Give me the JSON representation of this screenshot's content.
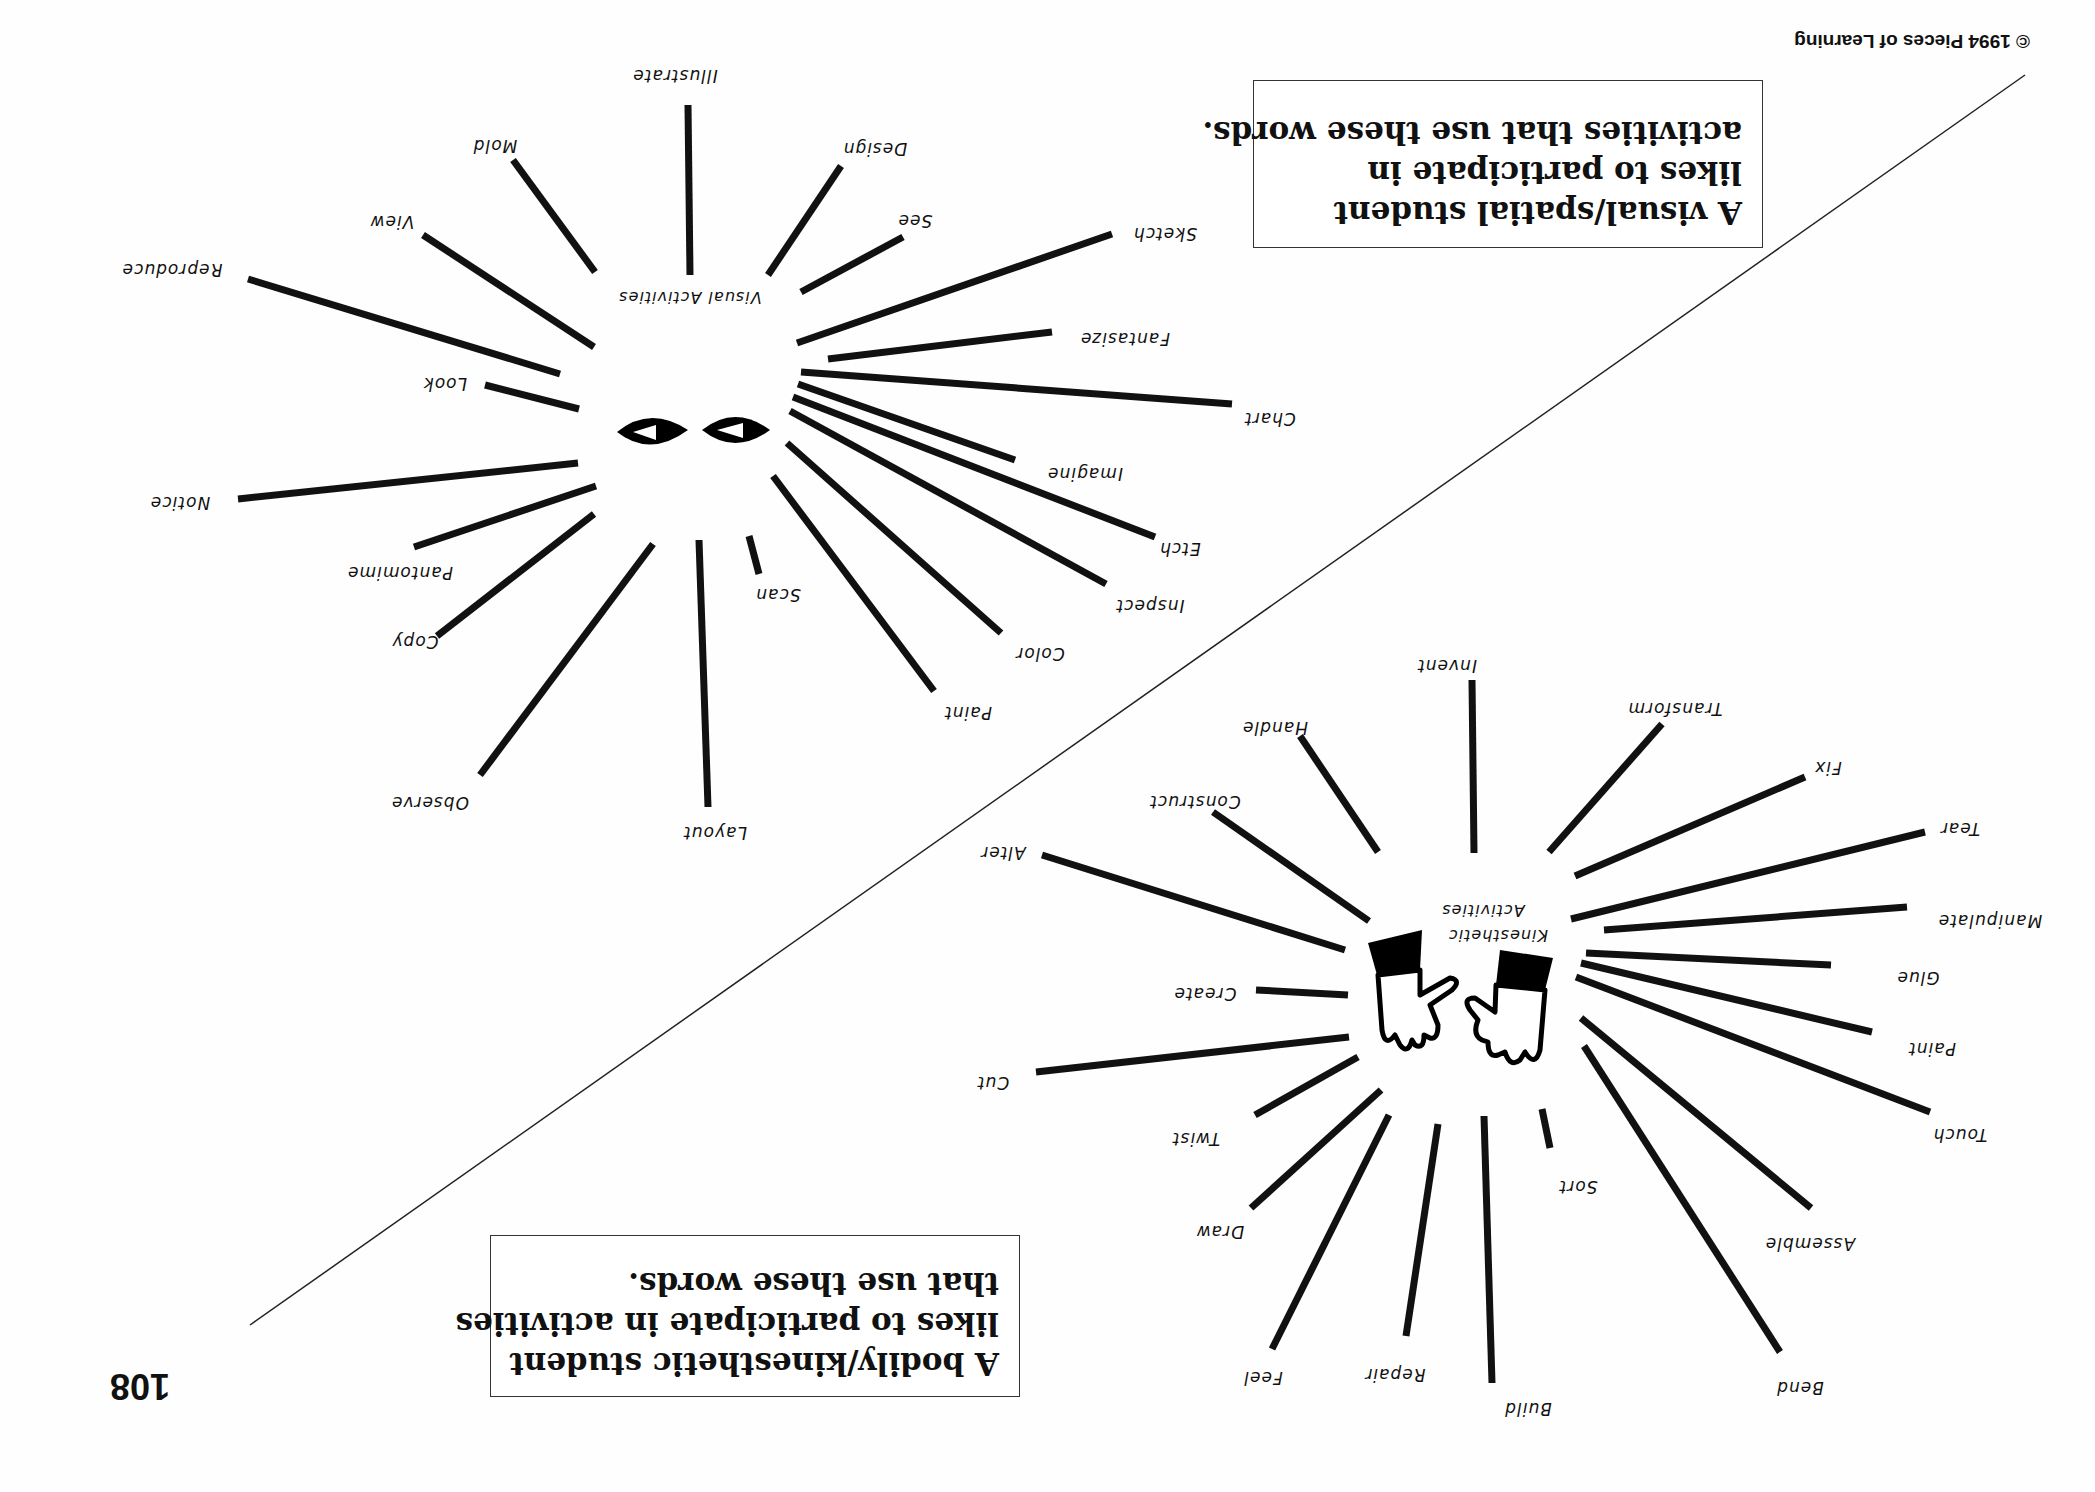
{
  "page": {
    "number": "108",
    "copyright": "© 1994 Pieces of Learning",
    "orientation": "rotated 180 degrees"
  },
  "visual": {
    "caption": [
      "A visual/spatial student",
      "likes to participate in",
      "activities that use these words."
    ],
    "hub_label": "Visual Activities",
    "icon": "eyes-icon",
    "words": [
      {
        "label": "Illustrate",
        "x": 675,
        "y": 70,
        "ray": [
          688,
          105,
          690,
          275
        ]
      },
      {
        "label": "Mold",
        "x": 495,
        "y": 140,
        "ray": [
          513,
          160,
          595,
          272
        ]
      },
      {
        "label": "Design",
        "x": 875,
        "y": 143,
        "ray": [
          841,
          166,
          768,
          275
        ]
      },
      {
        "label": "See",
        "x": 915,
        "y": 215,
        "ray": [
          903,
          237,
          801,
          292
        ]
      },
      {
        "label": "View",
        "x": 392,
        "y": 216,
        "ray": [
          423,
          235,
          594,
          347
        ]
      },
      {
        "label": "Sketch",
        "x": 1165,
        "y": 228,
        "ray": [
          1112,
          234,
          797,
          343
        ]
      },
      {
        "label": "Reproduce",
        "x": 172,
        "y": 264,
        "ray": [
          248,
          279,
          560,
          374
        ]
      },
      {
        "label": "Fantasize",
        "x": 1125,
        "y": 333,
        "ray": [
          1052,
          332,
          828,
          359
        ]
      },
      {
        "label": "Look",
        "x": 445,
        "y": 378,
        "ray": [
          485,
          385,
          579,
          409
        ]
      },
      {
        "label": "Chart",
        "x": 1270,
        "y": 413,
        "ray": [
          1232,
          404,
          801,
          372
        ]
      },
      {
        "label": "Imagine",
        "x": 1085,
        "y": 468,
        "ray": [
          1015,
          460,
          798,
          384
        ]
      },
      {
        "label": "Notice",
        "x": 180,
        "y": 497,
        "ray": [
          238,
          499,
          578,
          463
        ]
      },
      {
        "label": "Etch",
        "x": 1180,
        "y": 543,
        "ray": [
          1155,
          537,
          793,
          397
        ]
      },
      {
        "label": "Pantomime",
        "x": 400,
        "y": 567,
        "ray": [
          414,
          547,
          596,
          486
        ]
      },
      {
        "label": "Inspect",
        "x": 1150,
        "y": 600,
        "ray": [
          1106,
          584,
          790,
          411
        ]
      },
      {
        "label": "Scan",
        "x": 778,
        "y": 589,
        "ray": [
          759,
          574,
          749,
          536
        ]
      },
      {
        "label": "Copy",
        "x": 415,
        "y": 636,
        "ray": [
          437,
          636,
          594,
          514
        ]
      },
      {
        "label": "Color",
        "x": 1040,
        "y": 648,
        "ray": [
          1001,
          633,
          787,
          443
        ]
      },
      {
        "label": "Paint",
        "x": 968,
        "y": 707,
        "ray": [
          934,
          691,
          773,
          476
        ]
      },
      {
        "label": "Observe",
        "x": 430,
        "y": 797,
        "ray": [
          480,
          775,
          653,
          544
        ]
      },
      {
        "label": "Layout",
        "x": 715,
        "y": 827,
        "ray": [
          708,
          807,
          699,
          540
        ]
      }
    ]
  },
  "kinesthetic": {
    "caption": [
      "A bodily/kinesthetic student",
      "likes to participate in activities",
      "that use these words."
    ],
    "hub_label": [
      "Kinesthetic",
      "Activities"
    ],
    "icon": "hands-icon",
    "words": [
      {
        "label": "Invent",
        "x": 1447,
        "y": 660,
        "ray": [
          1472,
          680,
          1474,
          853
        ]
      },
      {
        "label": "Transform",
        "x": 1675,
        "y": 703,
        "ray": [
          1662,
          724,
          1549,
          852
        ]
      },
      {
        "label": "Handle",
        "x": 1275,
        "y": 722,
        "ray": [
          1300,
          736,
          1378,
          852
        ]
      },
      {
        "label": "Fix",
        "x": 1828,
        "y": 762,
        "ray": [
          1805,
          777,
          1575,
          876
        ]
      },
      {
        "label": "Construct",
        "x": 1195,
        "y": 796,
        "ray": [
          1213,
          812,
          1369,
          921
        ]
      },
      {
        "label": "Tear",
        "x": 1960,
        "y": 823,
        "ray": [
          1925,
          832,
          1571,
          919
        ]
      },
      {
        "label": "Alter",
        "x": 1003,
        "y": 847,
        "ray": [
          1042,
          855,
          1345,
          950
        ]
      },
      {
        "label": "Manipulate",
        "x": 1990,
        "y": 915,
        "ray": [
          1907,
          907,
          1604,
          930
        ]
      },
      {
        "label": "Glue",
        "x": 1918,
        "y": 972,
        "ray": [
          1831,
          965,
          1586,
          953
        ]
      },
      {
        "label": "Create",
        "x": 1205,
        "y": 988,
        "ray": [
          1256,
          990,
          1348,
          995
        ]
      },
      {
        "label": "Paint",
        "x": 1932,
        "y": 1043,
        "ray": [
          1872,
          1032,
          1581,
          963
        ]
      },
      {
        "label": "Cut",
        "x": 993,
        "y": 1077,
        "ray": [
          1036,
          1072,
          1349,
          1037
        ]
      },
      {
        "label": "Touch",
        "x": 1960,
        "y": 1129,
        "ray": [
          1930,
          1112,
          1576,
          977
        ]
      },
      {
        "label": "Twist",
        "x": 1196,
        "y": 1133,
        "ray": [
          1255,
          1115,
          1358,
          1057
        ]
      },
      {
        "label": "Sort",
        "x": 1578,
        "y": 1181,
        "ray": [
          1550,
          1148,
          1542,
          1109
        ]
      },
      {
        "label": "Draw",
        "x": 1220,
        "y": 1226,
        "ray": [
          1251,
          1208,
          1381,
          1090
        ]
      },
      {
        "label": "Assemble",
        "x": 1810,
        "y": 1238,
        "ray": [
          1811,
          1208,
          1581,
          1018
        ]
      },
      {
        "label": "Feel",
        "x": 1263,
        "y": 1372,
        "ray": [
          1272,
          1349,
          1389,
          1115
        ]
      },
      {
        "label": "Repair",
        "x": 1395,
        "y": 1369,
        "ray": [
          1406,
          1336,
          1438,
          1124
        ]
      },
      {
        "label": "Build",
        "x": 1528,
        "y": 1403,
        "ray": [
          1492,
          1383,
          1484,
          1116
        ]
      },
      {
        "label": "Bend",
        "x": 1800,
        "y": 1382,
        "ray": [
          1780,
          1352,
          1584,
          1046
        ]
      }
    ]
  },
  "divider": [
    250,
    1325,
    2025,
    75
  ]
}
